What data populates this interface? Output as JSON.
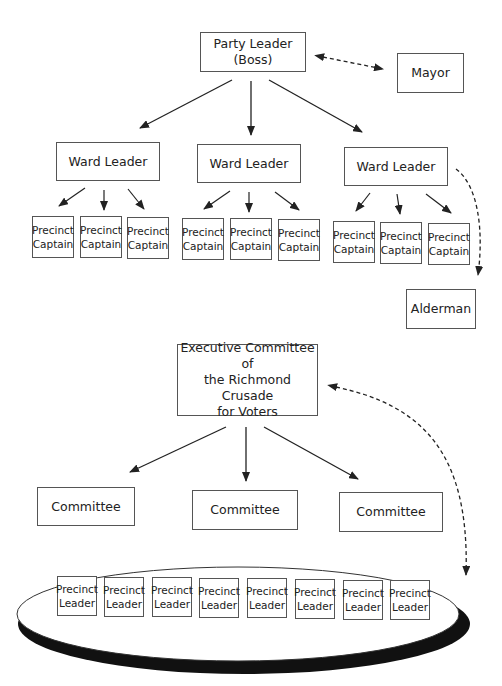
{
  "machine": {
    "boss": "Party Leader\n(Boss)",
    "mayor": "Mayor",
    "alderman": "Alderman",
    "ward_leaders": [
      "Ward Leader",
      "Ward Leader",
      "Ward Leader"
    ],
    "precinct_captain": [
      "Precinct",
      "Captain"
    ]
  },
  "crusade": {
    "executive": "Executive Committee of\nthe Richmond Crusade\nfor Voters",
    "committees": [
      "Committee",
      "Committee",
      "Committee"
    ],
    "precinct_leader": [
      "Precinct",
      "Leader"
    ]
  },
  "colors": {
    "line": "#222222",
    "box_border": "#555555",
    "ellipse_shadow": "#111111"
  }
}
